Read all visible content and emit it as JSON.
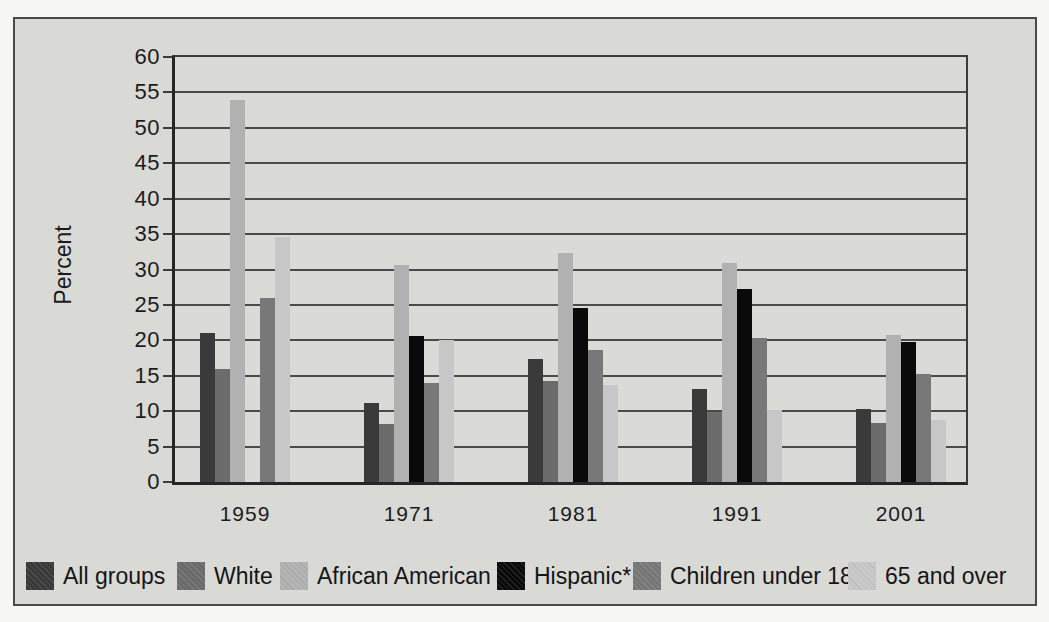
{
  "figure": {
    "kind": "scanned textbook grouped bar chart",
    "background_color": "#d9d9d6",
    "frame_border_color": "#4a4a4a"
  },
  "chart_data": {
    "type": "bar",
    "title": "",
    "xlabel": "",
    "ylabel": "Percent",
    "ylim": [
      0,
      60
    ],
    "ytick_step": 5,
    "yticks": [
      60,
      55,
      50,
      45,
      40,
      35,
      30,
      25,
      20,
      15,
      10,
      5,
      0
    ],
    "grid": true,
    "legend_position": "bottom",
    "categories": [
      "1959",
      "1971",
      "1981",
      "1991",
      "2001"
    ],
    "series": [
      {
        "name": "All groups",
        "color": "#3a3a3a",
        "values": [
          21.0,
          11.2,
          17.4,
          13.2,
          10.3
        ]
      },
      {
        "name": "White",
        "color": "#6c6c6c",
        "values": [
          16.0,
          8.2,
          14.3,
          9.9,
          8.4
        ]
      },
      {
        "name": "African American",
        "color": "#b1b1b1",
        "values": [
          54.0,
          30.6,
          32.4,
          30.9,
          20.8
        ]
      },
      {
        "name": "Hispanic*",
        "color": "#0a0a0a",
        "values": [
          null,
          20.6,
          24.6,
          27.2,
          19.8
        ]
      },
      {
        "name": "Children under 18",
        "color": "#787878",
        "values": [
          26.0,
          14.0,
          18.6,
          20.4,
          15.2
        ]
      },
      {
        "name": "65 and over",
        "color": "#c7c7c7",
        "values": [
          34.6,
          20.0,
          13.7,
          10.2,
          8.8
        ]
      }
    ]
  },
  "legend_layout": {
    "item_lefts": [
      26,
      177,
      280,
      497,
      633,
      848
    ]
  }
}
